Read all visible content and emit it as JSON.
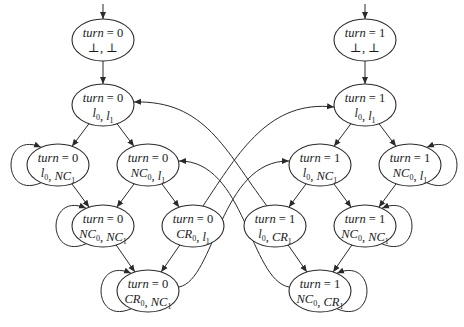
{
  "diagram": {
    "nodes": [
      {
        "id": "L0",
        "cx": 103,
        "cy": 40,
        "line1": {
          "var": "turn",
          "op": " = ",
          "val": "0"
        },
        "line2": [
          {
            "t": "⊥"
          },
          {
            "t": ", "
          },
          {
            "t": "⊥"
          }
        ],
        "initial": true
      },
      {
        "id": "L1",
        "cx": 103,
        "cy": 105,
        "line1": {
          "var": "turn",
          "op": " = ",
          "val": "0"
        },
        "line2": [
          {
            "t": "l",
            "s": "0"
          },
          {
            "t": ", "
          },
          {
            "t": "l",
            "s": "1"
          }
        ]
      },
      {
        "id": "L2a",
        "cx": 58,
        "cy": 165,
        "line1": {
          "var": "turn",
          "op": " = ",
          "val": "0"
        },
        "line2": [
          {
            "t": "l",
            "s": "0"
          },
          {
            "t": ", "
          },
          {
            "t": "NC",
            "s": "1"
          }
        ]
      },
      {
        "id": "L2b",
        "cx": 148,
        "cy": 165,
        "line1": {
          "var": "turn",
          "op": " = ",
          "val": "0"
        },
        "line2": [
          {
            "t": "NC",
            "s": "0"
          },
          {
            "t": ", "
          },
          {
            "t": "l",
            "s": "1"
          }
        ]
      },
      {
        "id": "L3a",
        "cx": 103,
        "cy": 226,
        "line1": {
          "var": "turn",
          "op": " = ",
          "val": "0"
        },
        "line2": [
          {
            "t": "NC",
            "s": "0"
          },
          {
            "t": ", "
          },
          {
            "t": "NC",
            "s": "1"
          }
        ]
      },
      {
        "id": "L3b",
        "cx": 193,
        "cy": 226,
        "line1": {
          "var": "turn",
          "op": " = ",
          "val": "0"
        },
        "line2": [
          {
            "t": "CR",
            "s": "0"
          },
          {
            "t": ", "
          },
          {
            "t": "l",
            "s": "1"
          }
        ]
      },
      {
        "id": "L4",
        "cx": 148,
        "cy": 291,
        "line1": {
          "var": "turn",
          "op": " = ",
          "val": "0"
        },
        "line2": [
          {
            "t": "CR",
            "s": "0"
          },
          {
            "t": ", "
          },
          {
            "t": "NC",
            "s": "1"
          }
        ]
      },
      {
        "id": "R0",
        "cx": 365,
        "cy": 40,
        "line1": {
          "var": "turn",
          "op": " = ",
          "val": "1"
        },
        "line2": [
          {
            "t": "⊥"
          },
          {
            "t": ", "
          },
          {
            "t": "⊥"
          }
        ],
        "initial": true
      },
      {
        "id": "R1",
        "cx": 365,
        "cy": 105,
        "line1": {
          "var": "turn",
          "op": " = ",
          "val": "1"
        },
        "line2": [
          {
            "t": "l",
            "s": "0"
          },
          {
            "t": ", "
          },
          {
            "t": "l",
            "s": "1"
          }
        ]
      },
      {
        "id": "R2a",
        "cx": 320,
        "cy": 165,
        "line1": {
          "var": "turn",
          "op": " = ",
          "val": "1"
        },
        "line2": [
          {
            "t": "l",
            "s": "0"
          },
          {
            "t": ", "
          },
          {
            "t": "NC",
            "s": "1"
          }
        ]
      },
      {
        "id": "R2b",
        "cx": 410,
        "cy": 165,
        "line1": {
          "var": "turn",
          "op": " = ",
          "val": "1"
        },
        "line2": [
          {
            "t": "NC",
            "s": "0"
          },
          {
            "t": ", "
          },
          {
            "t": "l",
            "s": "1"
          }
        ]
      },
      {
        "id": "R3a",
        "cx": 275,
        "cy": 226,
        "line1": {
          "var": "turn",
          "op": " = ",
          "val": "1"
        },
        "line2": [
          {
            "t": "l",
            "s": "0"
          },
          {
            "t": ", "
          },
          {
            "t": "CR",
            "s": "1"
          }
        ]
      },
      {
        "id": "R3b",
        "cx": 365,
        "cy": 226,
        "line1": {
          "var": "turn",
          "op": " = ",
          "val": "1"
        },
        "line2": [
          {
            "t": "NC",
            "s": "0"
          },
          {
            "t": ", "
          },
          {
            "t": "NC",
            "s": "1"
          }
        ]
      },
      {
        "id": "R4",
        "cx": 320,
        "cy": 291,
        "line1": {
          "var": "turn",
          "op": " = ",
          "val": "1"
        },
        "line2": [
          {
            "t": "NC",
            "s": "0"
          },
          {
            "t": ", "
          },
          {
            "t": "CR",
            "s": "1"
          }
        ]
      }
    ],
    "edges": [
      {
        "from": "L0",
        "to": "L1"
      },
      {
        "from": "L1",
        "to": "L2a"
      },
      {
        "from": "L1",
        "to": "L2b"
      },
      {
        "from": "L2a",
        "to": "L3a"
      },
      {
        "from": "L2b",
        "to": "L3a"
      },
      {
        "from": "L2b",
        "to": "L3b"
      },
      {
        "from": "L3a",
        "to": "L4"
      },
      {
        "from": "L3b",
        "to": "L4"
      },
      {
        "from": "R0",
        "to": "R1"
      },
      {
        "from": "R1",
        "to": "R2a"
      },
      {
        "from": "R1",
        "to": "R2b"
      },
      {
        "from": "R2a",
        "to": "R3a"
      },
      {
        "from": "R2a",
        "to": "R3b"
      },
      {
        "from": "R2b",
        "to": "R3b"
      },
      {
        "from": "R3a",
        "to": "R4"
      },
      {
        "from": "R3b",
        "to": "R4"
      },
      {
        "from": "L3b",
        "to": "R1",
        "curved": true
      },
      {
        "from": "R3a",
        "to": "L1",
        "curved": true
      },
      {
        "from": "L4",
        "to": "R2a",
        "curved": true
      },
      {
        "from": "R4",
        "to": "L2b",
        "curved": true
      },
      {
        "from": "L2a",
        "to": "L2a",
        "self": true
      },
      {
        "from": "L3a",
        "to": "L3a",
        "self": true
      },
      {
        "from": "L4",
        "to": "L4",
        "self": true
      },
      {
        "from": "R2b",
        "to": "R2b",
        "self": true
      },
      {
        "from": "R3b",
        "to": "R3b",
        "self": true
      },
      {
        "from": "R4",
        "to": "R4",
        "self": true
      }
    ]
  }
}
